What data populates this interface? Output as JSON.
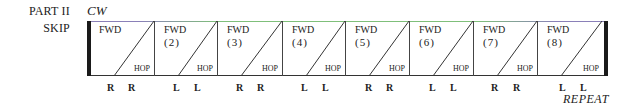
{
  "header": {
    "part_label": "PART II",
    "skip_label": "SKIP",
    "direction": "CW"
  },
  "cells": [
    {
      "fwd": "FWD",
      "number": "",
      "hop": "HOP",
      "feet": [
        "R",
        "R"
      ]
    },
    {
      "fwd": "FWD",
      "number": "(2)",
      "hop": "HOP",
      "feet": [
        "L",
        "L"
      ]
    },
    {
      "fwd": "FWD",
      "number": "(3)",
      "hop": "HOP",
      "feet": [
        "R",
        "R"
      ]
    },
    {
      "fwd": "FWD",
      "number": "(4)",
      "hop": "HOP",
      "feet": [
        "L",
        "L"
      ]
    },
    {
      "fwd": "FWD",
      "number": "(5)",
      "hop": "HOP",
      "feet": [
        "R",
        "R"
      ]
    },
    {
      "fwd": "FWD",
      "number": "(6)",
      "hop": "HOP",
      "feet": [
        "L",
        "L"
      ]
    },
    {
      "fwd": "FWD",
      "number": "(7)",
      "hop": "HOP",
      "feet": [
        "R",
        "R"
      ]
    },
    {
      "fwd": "FWD",
      "number": "(8)",
      "hop": "HOP",
      "feet": [
        "L",
        "L"
      ]
    }
  ],
  "footer": {
    "repeat_label": "REPEAT"
  },
  "colors": {
    "line": "#333333",
    "bar": "#1a1a1a",
    "top_border_green": "#7fbf7a",
    "top_border_lavender": "#8a80b8"
  }
}
